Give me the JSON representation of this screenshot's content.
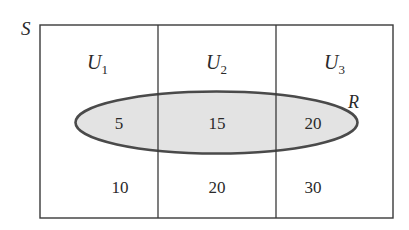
{
  "diagram": {
    "sample_space_label": "S",
    "event_label": "R",
    "partitions": [
      {
        "label": "U",
        "subscript": "1",
        "inside_R": "5",
        "outside_R": "10"
      },
      {
        "label": "U",
        "subscript": "2",
        "inside_R": "15",
        "outside_R": "20"
      },
      {
        "label": "U",
        "subscript": "3",
        "inside_R": "20",
        "outside_R": "30"
      }
    ],
    "colors": {
      "border": "#3a3a3a",
      "ellipse_fill": "#e3e3e3",
      "ellipse_stroke": "#4a4a4a",
      "text": "#2a2a2a"
    }
  }
}
